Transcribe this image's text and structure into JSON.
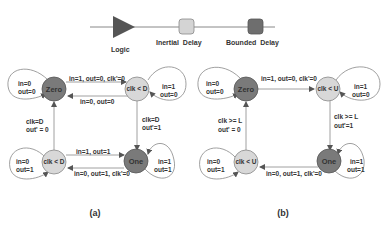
{
  "legend": {
    "logic": "Logic",
    "inertial_delay": "Inertial  Delay",
    "bounded_delay": "Bounded  Delay",
    "colors": {
      "logic": "#555555",
      "inertial": "#d4d4d4",
      "bounded": "#6e6e6e"
    }
  },
  "diagram_a": {
    "caption": "(a)",
    "nodes": {
      "zero": "Zero",
      "top_right": "clk < D",
      "bottom_left": "clk < D",
      "one": "One"
    },
    "self_loops": {
      "zero": [
        "in=0",
        "out=0"
      ],
      "top_right": [
        "in=1",
        "out=0"
      ],
      "bottom_left": [
        "in=0",
        "out=1"
      ],
      "one": [
        "in=1",
        "out=1"
      ]
    },
    "edges": {
      "zero_to_tr": "in=1, out=0, clk'=0",
      "tr_to_zero": "in=0, out=0",
      "tr_to_one": [
        "clk=D",
        "out'=1"
      ],
      "bl_to_zero": [
        "clk=D",
        "out' = 0"
      ],
      "bl_to_one": "in=1, out=1",
      "one_to_bl": "in=0, out=1, clk'=0"
    }
  },
  "diagram_b": {
    "caption": "(b)",
    "nodes": {
      "zero": "Zero",
      "top_right": "clk < U",
      "bottom_left": "clk < U",
      "one": "One"
    },
    "self_loops": {
      "zero": [
        "in=0",
        "out=0"
      ],
      "top_right": [
        "in=1",
        "out=0"
      ],
      "bottom_left": [
        "in=0",
        "out=1"
      ],
      "one": [
        "in=1",
        "out=1"
      ]
    },
    "edges": {
      "zero_to_tr": "in=1, out=0, clk'=0",
      "tr_to_one": [
        "clk >= L",
        "out'=1"
      ],
      "bl_to_zero": [
        "clk >= L",
        "out' = 0"
      ],
      "one_to_bl": "in=0, out=1, clk'=0"
    }
  },
  "colors": {
    "dark_node": "#7a7a7a",
    "light_node": "#d8d8d8",
    "line": "#777777"
  }
}
